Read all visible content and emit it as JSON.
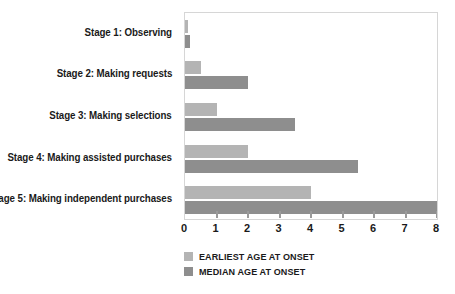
{
  "chart_data": {
    "type": "bar",
    "orientation": "horizontal",
    "title": "",
    "xlabel": "",
    "ylabel": "",
    "xlim": [
      0,
      8
    ],
    "grid": false,
    "legend_position": "bottom-left",
    "xticks": [
      "0",
      "1",
      "2",
      "3",
      "4",
      "5",
      "6",
      "7",
      "8"
    ],
    "categories": [
      "Stage 1: Observing",
      "Stage 2: Making requests",
      "Stage 3: Making selections",
      "Stage 4: Making assisted purchases",
      "Stage 5: Making independent purchases"
    ],
    "series": [
      {
        "name": "EARLIEST AGE AT ONSET",
        "color": "#b4b4b4",
        "values": [
          0.1,
          0.5,
          1.0,
          2.0,
          4.0
        ]
      },
      {
        "name": "MEDIAN AGE AT ONSET",
        "color": "#8e8e8e",
        "values": [
          0.15,
          2.0,
          3.5,
          5.5,
          8.0
        ]
      }
    ]
  },
  "legend": {
    "items": [
      {
        "label": "EARLIEST AGE AT ONSET"
      },
      {
        "label": "MEDIAN AGE AT ONSET"
      }
    ]
  }
}
